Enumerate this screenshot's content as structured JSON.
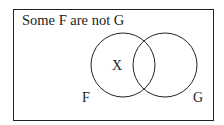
{
  "diagram": {
    "title": "Some F are not G",
    "circles": [
      {
        "label": "F",
        "cx": 123,
        "cy": 65,
        "r": 32
      },
      {
        "label": "G",
        "cx": 165,
        "cy": 65,
        "r": 32
      }
    ],
    "marker": "X",
    "colors": {
      "stroke": "#222222",
      "background": "#ffffff"
    }
  }
}
